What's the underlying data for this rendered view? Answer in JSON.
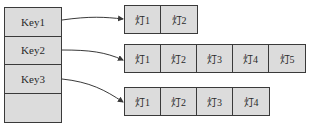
{
  "keys": [
    {
      "label": "Key1"
    },
    {
      "label": "Key2"
    },
    {
      "label": "Key3"
    },
    {
      "label": ""
    }
  ],
  "chains": [
    {
      "key": "Key1",
      "items": [
        "灯1",
        "灯2"
      ]
    },
    {
      "key": "Key2",
      "items": [
        "灯1",
        "灯2",
        "灯3",
        "灯4",
        "灯5"
      ]
    },
    {
      "key": "Key3",
      "items": [
        "灯1",
        "灯2",
        "灯3",
        "灯4"
      ]
    }
  ],
  "colors": {
    "fill": "#dcdcdc",
    "stroke": "#3a3a3a",
    "text": "#2a2a2a"
  }
}
